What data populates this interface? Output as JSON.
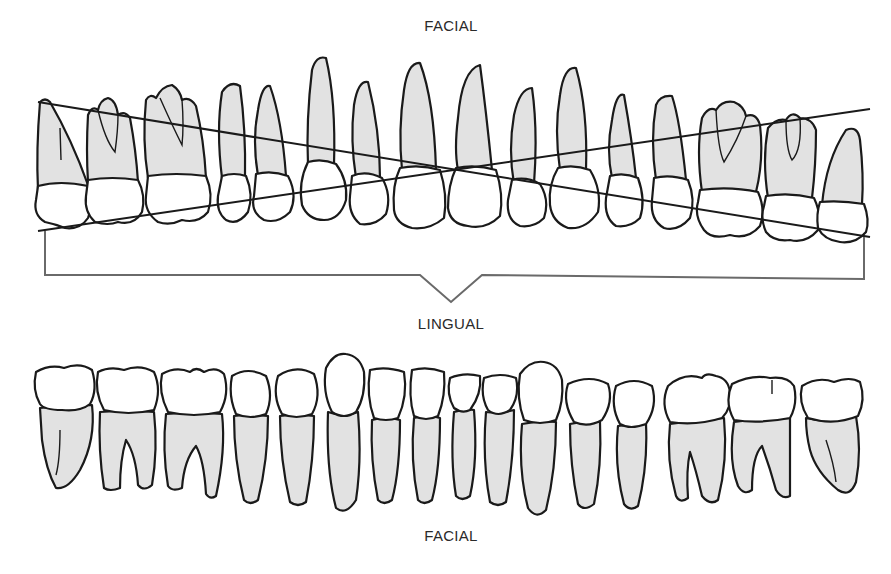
{
  "labels": {
    "top": "FACIAL",
    "middle": "LINGUAL",
    "bottom": "FACIAL"
  },
  "colors": {
    "root_fill": "#e2e2e2",
    "crown_fill": "#ffffff",
    "outline": "#1a1a1a",
    "bracket": "#6a6a6a",
    "text": "#2a2a2a"
  },
  "maxillary_arch": {
    "tooth_count": 16,
    "reference_lines": 2
  },
  "mandibular_arch": {
    "tooth_count": 16
  }
}
